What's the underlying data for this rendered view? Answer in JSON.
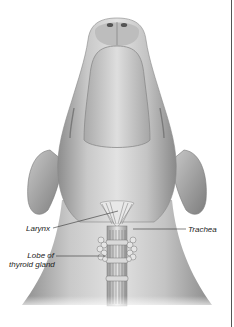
{
  "figure": {
    "labels": {
      "larynx": "Larynx",
      "trachea": "Trachea",
      "thyroid_line1": "Lobe of",
      "thyroid_line2": "thyroid gland"
    },
    "colors": {
      "background": "#ffffff",
      "skin_light": "#e4e4e4",
      "skin_mid": "#b8b8b8",
      "skin_dark": "#8a8a8a",
      "leader_line": "#333333",
      "border": "#555555"
    }
  }
}
